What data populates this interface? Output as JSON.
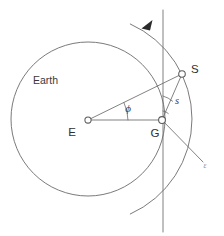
{
  "figure": {
    "domain": "diagram",
    "kind": "satellite-ground-station-geometry",
    "canvas": {
      "width": 224,
      "height": 236
    },
    "background_color": "#ffffff",
    "line_color": "#6b6b6b",
    "label_color": "#3a3a3a",
    "arrow_color": "#2b2b2b"
  },
  "labels": {
    "earth": "Earth",
    "earth_center": "E",
    "ground_station": "G",
    "satellite": "S",
    "central_angle": "ϕ",
    "slant_range": "s",
    "elevation_angle": "ε"
  },
  "points": {
    "E": {
      "label": "E",
      "x": 88,
      "y": 120,
      "label_x": 72,
      "label_y": 133
    },
    "G": {
      "label": "G",
      "x": 162,
      "y": 120,
      "label_x": 155,
      "label_y": 134
    },
    "S": {
      "label": "S",
      "x": 182,
      "y": 74,
      "label_x": 191,
      "label_y": 70
    }
  },
  "annotations": {
    "earth_label": {
      "text": "Earth",
      "x": 33,
      "y": 81
    },
    "phi_label": {
      "text": "ϕ",
      "x": 128,
      "y": 111
    },
    "s_label": {
      "text": "s",
      "x": 177,
      "y": 103
    },
    "epsilon_label": {
      "text": "ε",
      "x": 205,
      "y": 168
    }
  },
  "geometry": {
    "earth_circle": {
      "cx": 88,
      "cy": 119,
      "r": 77
    },
    "orbit_arc": {
      "cx": 88,
      "cy": 119,
      "r": 104,
      "start_deg": -66,
      "end_deg": 66
    },
    "vertical_line": {
      "x": 163,
      "y1": 10,
      "y2": 232
    },
    "segment_EG": {
      "x1": 88,
      "y1": 120,
      "x2": 162,
      "y2": 120
    },
    "segment_ES": {
      "x1": 88,
      "y1": 120,
      "x2": 182,
      "y2": 74
    },
    "segment_GS": {
      "x1": 162,
      "y1": 120,
      "x2": 182,
      "y2": 74
    },
    "segment_G_epsilon": {
      "x1": 162,
      "y1": 120,
      "x2": 203,
      "y2": 162
    },
    "phi_arc": {
      "cx": 88,
      "cy": 120,
      "r": 40,
      "start_deg": -26,
      "end_deg": 0
    },
    "zenith_arc": {
      "cx": 162,
      "cy": 120,
      "r": 24,
      "start_deg": -90,
      "end_deg": -66
    },
    "right_angle_tick": {
      "cx": 162,
      "cy": 120,
      "r": 9
    },
    "direction_arrow": {
      "x": 148,
      "y": 25,
      "angle_deg": 208
    }
  }
}
